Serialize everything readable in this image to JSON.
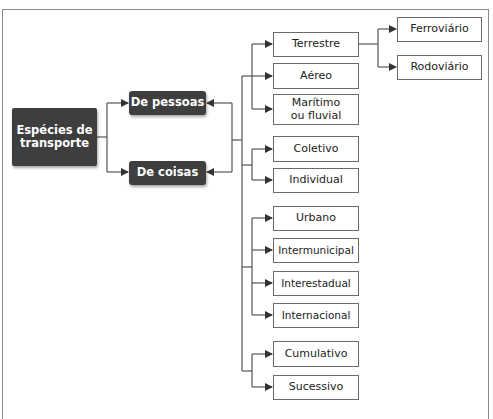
{
  "diagram": {
    "root": {
      "label": "Espécies de transporte"
    },
    "level1": [
      {
        "label": "De pessoas"
      },
      {
        "label": "De coisas"
      }
    ],
    "groups": [
      {
        "name": "modalidade",
        "items": [
          {
            "label": "Terrestre",
            "children": [
              {
                "label": "Ferroviário"
              },
              {
                "label": "Rodoviário"
              }
            ]
          },
          {
            "label": "Aéreo"
          },
          {
            "label": "Marítimo ou fluvial"
          }
        ]
      },
      {
        "name": "uso",
        "items": [
          {
            "label": "Coletivo"
          },
          {
            "label": "Individual"
          }
        ]
      },
      {
        "name": "abrangencia",
        "items": [
          {
            "label": "Urbano"
          },
          {
            "label": "Intermunicipal"
          },
          {
            "label": "Interestadual"
          },
          {
            "label": "Internacional"
          }
        ]
      },
      {
        "name": "sequencia",
        "items": [
          {
            "label": "Cumulativo"
          },
          {
            "label": "Sucessivo"
          }
        ]
      }
    ],
    "colors": {
      "dark_box": "#3e3e3e",
      "line": "#555555",
      "frame": "#8a8a8a"
    }
  }
}
